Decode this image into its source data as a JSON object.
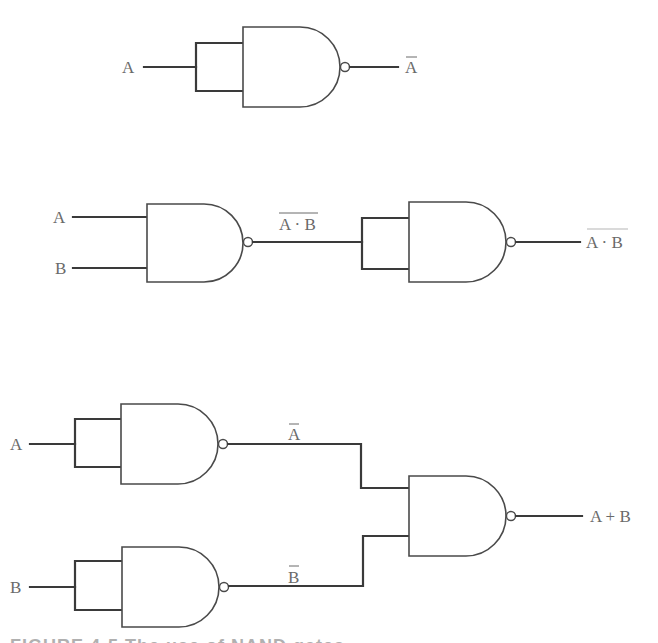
{
  "diagram": {
    "colors": {
      "line": "#3a3a3a",
      "gate_outline": "#4a4a4a",
      "label": "#6a6a6a",
      "background": "#ffffff"
    },
    "circuits": [
      {
        "name": "NOT from NAND",
        "input_label": "A",
        "output_label": "A",
        "output_negated": true
      },
      {
        "name": "AND from NAND",
        "inputs": [
          "A",
          "B"
        ],
        "intermediate_label": "A · B",
        "intermediate_negated": true,
        "output_label": "A · B",
        "output_double_negated": true
      },
      {
        "name": "OR from NAND",
        "inputs": [
          "A",
          "B"
        ],
        "intermediate_labels": [
          "A",
          "B"
        ],
        "intermediate_negated": true,
        "output_label": "A + B"
      }
    ],
    "caption": "FIGURE 4-5  The use of NAND gates"
  }
}
